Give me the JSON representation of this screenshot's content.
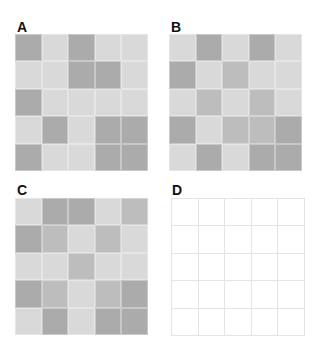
{
  "colors": {
    "light": "#d9d9d9",
    "medium": "#bdbdbd",
    "dark": "#ababab",
    "empty": "#ffffff",
    "gridline": "#e4e4e4"
  },
  "panels": [
    {
      "label": "A",
      "cells": [
        [
          2,
          0,
          2,
          0,
          0
        ],
        [
          0,
          0,
          2,
          2,
          0
        ],
        [
          2,
          0,
          0,
          0,
          0
        ],
        [
          0,
          2,
          0,
          2,
          2
        ],
        [
          2,
          0,
          0,
          2,
          2
        ]
      ]
    },
    {
      "label": "B",
      "cells": [
        [
          0,
          2,
          0,
          2,
          0
        ],
        [
          2,
          0,
          1,
          0,
          0
        ],
        [
          0,
          1,
          0,
          1,
          0
        ],
        [
          2,
          0,
          1,
          1,
          2
        ],
        [
          0,
          2,
          0,
          2,
          2
        ]
      ]
    },
    {
      "label": "C",
      "cells": [
        [
          0,
          2,
          2,
          0,
          1
        ],
        [
          2,
          1,
          0,
          1,
          0
        ],
        [
          0,
          0,
          1,
          0,
          0
        ],
        [
          2,
          1,
          0,
          1,
          2
        ],
        [
          0,
          2,
          0,
          2,
          2
        ]
      ]
    },
    {
      "label": "D",
      "cells": null
    }
  ]
}
